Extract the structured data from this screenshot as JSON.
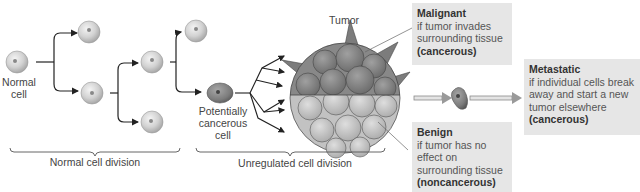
{
  "diagram": {
    "labels": {
      "normal_cell": "Normal cell",
      "potentially_cancerous_cell": "Potentially cancerous cell",
      "tumor": "Tumor",
      "normal_cell_division": "Normal cell division",
      "unregulated_cell_division": "Unregulated cell division"
    },
    "outcomes": {
      "malignant": {
        "title": "Malignant",
        "description": "if tumor invades surrounding tissue",
        "classification": "(cancerous)"
      },
      "benign": {
        "title": "Benign",
        "description": "if tumor has no effect on surrounding tissue",
        "classification": "(noncancerous)"
      },
      "metastatic": {
        "title": "Metastatic",
        "description": "if individual cells break away and start a new tumor elsewhere",
        "classification": "(cancerous)"
      }
    },
    "colors": {
      "box_bg": "#e6e6e6",
      "normal_cell": "#d4d4d4",
      "cancer_cell": "#8a8a8a",
      "arrow": "#222222",
      "double_arrow": "#9a9a9a"
    }
  }
}
